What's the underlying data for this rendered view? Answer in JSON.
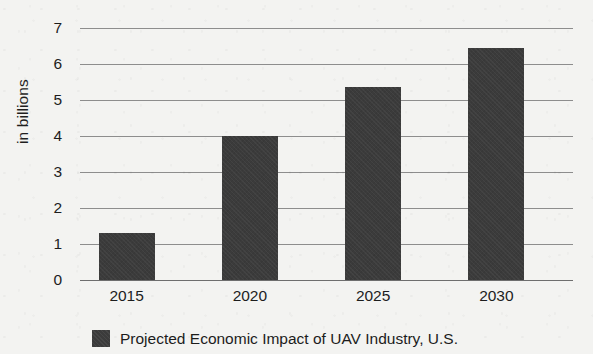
{
  "chart_data": {
    "type": "bar",
    "title": "",
    "subtitle": "",
    "xlabel": "",
    "ylabel": "in billions",
    "categories": [
      "2015",
      "2020",
      "2025",
      "2030"
    ],
    "values": [
      1.3,
      4.0,
      5.35,
      6.45
    ],
    "series": [
      {
        "name": "Projected Economic Impact of UAV Industry, U.S.",
        "values": [
          1.3,
          4.0,
          5.35,
          6.45
        ]
      }
    ],
    "ylim": [
      0,
      7
    ],
    "y_ticks": [
      "0",
      "1",
      "2",
      "3",
      "4",
      "5",
      "6",
      "7"
    ],
    "y_tick_values": [
      0,
      1,
      2,
      3,
      4,
      5,
      6,
      7
    ],
    "grid": true,
    "grid_axis": "y",
    "legend": {
      "position": "bottom",
      "entries": [
        {
          "label": "Projected Economic Impact of UAV Industry, U.S.",
          "swatch_name": "legend-swatch-uav-impact"
        }
      ]
    },
    "colors": {
      "bar": "#3b3b3b",
      "gridline": "#8d8d8d",
      "axis": "#6e6e6e",
      "background": "#f3f3f1",
      "text": "#1c1c1c"
    }
  }
}
